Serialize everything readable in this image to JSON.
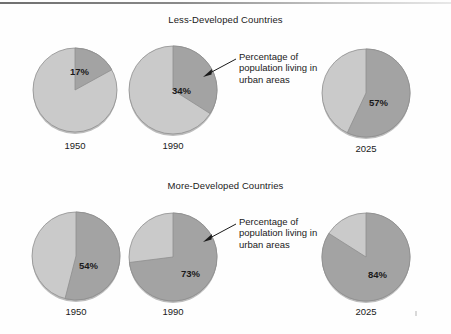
{
  "figure": {
    "width": 451,
    "height": 334,
    "background": "#fefefe",
    "rule_color": "#6f6f6f"
  },
  "colors": {
    "urban_slice": "#a3a3a3",
    "rural_slice": "#cacaca",
    "slice_outline": "#8e8e8e",
    "text": "#1a1a1a",
    "shadow": "#bdbdbd"
  },
  "panels": [
    {
      "title": "Less-Developed Countries",
      "annotation": {
        "line1": "Percentage of",
        "line2": "population living in",
        "line3": "urban areas"
      },
      "pies": [
        {
          "year": "1950",
          "percent": 17,
          "label": "17%"
        },
        {
          "year": "1990",
          "percent": 34,
          "label": "34%"
        },
        {
          "year": "2025",
          "percent": 57,
          "label": "57%"
        }
      ]
    },
    {
      "title": "More-Developed Countries",
      "annotation": {
        "line1": "Percentage of",
        "line2": "population living in",
        "line3": "urban areas"
      },
      "pies": [
        {
          "year": "1950",
          "percent": 54,
          "label": "54%"
        },
        {
          "year": "1990",
          "percent": 73,
          "label": "73%"
        },
        {
          "year": "2025",
          "percent": 84,
          "label": "84%"
        }
      ]
    }
  ],
  "chart_data": {
    "type": "pie",
    "title": "Percentage of population living in urban areas",
    "categories": [
      "1950",
      "1990",
      "2025"
    ],
    "series": [
      {
        "name": "Less-Developed Countries",
        "values": [
          17,
          34,
          57
        ]
      },
      {
        "name": "More-Developed Countries",
        "values": [
          54,
          73,
          84
        ]
      }
    ],
    "slice_names": [
      "urban",
      "rural"
    ],
    "units": "percent",
    "ylim": [
      0,
      100
    ],
    "grid": false,
    "legend": "none",
    "annotations": [
      "Percentage of population living in urban areas",
      "Percentage of population living in urban areas"
    ]
  }
}
